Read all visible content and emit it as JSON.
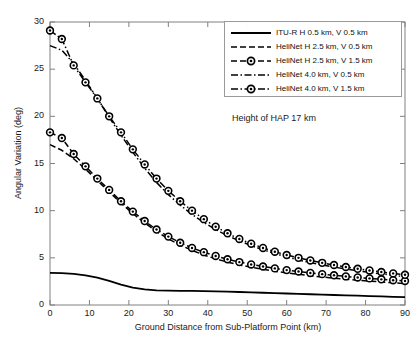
{
  "chart_data": {
    "type": "line",
    "title": "",
    "xlabel": "Ground Distance from Sub-Platform Point (km)",
    "ylabel": "Angular Variation (deg)",
    "xlim": [
      0,
      90
    ],
    "ylim": [
      0,
      30
    ],
    "xticks": [
      0,
      10,
      20,
      30,
      40,
      50,
      60,
      70,
      80,
      90
    ],
    "yticks": [
      0,
      5,
      10,
      15,
      20,
      25,
      30
    ],
    "grid": false,
    "legend_position": "top-right",
    "annotation": "Height of HAP 17 km",
    "x": [
      0,
      3,
      6,
      9,
      12,
      15,
      18,
      21,
      24,
      27,
      30,
      33,
      36,
      39,
      42,
      45,
      48,
      51,
      54,
      57,
      60,
      63,
      66,
      69,
      72,
      75,
      78,
      81,
      84,
      87,
      90
    ],
    "series": [
      {
        "name": "ITU-R H 0.5 km, V 0.5 km",
        "style": "solid",
        "marker": "none",
        "values": [
          3.4,
          3.38,
          3.3,
          3.15,
          2.9,
          2.55,
          2.15,
          1.85,
          1.65,
          1.56,
          1.52,
          1.5,
          1.49,
          1.47,
          1.45,
          1.42,
          1.38,
          1.34,
          1.3,
          1.26,
          1.22,
          1.18,
          1.14,
          1.1,
          1.06,
          1.02,
          0.99,
          0.95,
          0.91,
          0.87,
          0.83
        ]
      },
      {
        "name": "HeliNet H 2.5 km, V 0.5 km",
        "style": "dashed",
        "marker": "none",
        "values": [
          17.0,
          16.4,
          15.5,
          14.4,
          13.2,
          12.0,
          10.8,
          9.7,
          8.7,
          7.8,
          7.0,
          6.35,
          5.8,
          5.3,
          4.9,
          4.55,
          4.25,
          4.0,
          3.78,
          3.58,
          3.4,
          3.25,
          3.1,
          2.97,
          2.85,
          2.74,
          2.63,
          2.53,
          2.44,
          2.35,
          2.27
        ]
      },
      {
        "name": "HeliNet H 2.5 km, V 1.5 km",
        "style": "dashed",
        "marker": "circle",
        "values": [
          18.3,
          17.7,
          16.0,
          14.7,
          13.4,
          12.2,
          11.0,
          9.9,
          8.9,
          8.0,
          7.25,
          6.6,
          6.05,
          5.6,
          5.2,
          4.85,
          4.55,
          4.3,
          4.08,
          3.88,
          3.7,
          3.55,
          3.4,
          3.27,
          3.15,
          3.03,
          2.92,
          2.82,
          2.72,
          2.63,
          2.55
        ]
      },
      {
        "name": "HeliNet 4.0 km, V 0.5 km",
        "style": "dashdot",
        "marker": "none",
        "values": [
          27.5,
          27.0,
          25.6,
          23.8,
          21.9,
          19.9,
          18.0,
          16.2,
          14.5,
          13.0,
          11.7,
          10.6,
          9.6,
          8.75,
          8.0,
          7.35,
          6.8,
          6.3,
          5.85,
          5.45,
          5.1,
          4.78,
          4.5,
          4.25,
          4.02,
          3.82,
          3.63,
          3.46,
          3.3,
          3.15,
          3.0
        ]
      },
      {
        "name": "HeliNet 4.0 km, V 1.5 km",
        "style": "dashdot",
        "marker": "circle",
        "values": [
          29.1,
          28.2,
          25.4,
          23.6,
          21.9,
          20.0,
          18.3,
          16.5,
          14.9,
          13.4,
          12.1,
          11.0,
          10.0,
          9.1,
          8.3,
          7.6,
          7.0,
          6.5,
          6.05,
          5.65,
          5.3,
          5.0,
          4.72,
          4.47,
          4.24,
          4.03,
          3.84,
          3.66,
          3.5,
          3.35,
          3.2
        ]
      }
    ]
  },
  "colors": {
    "line": "#000000",
    "axis": "#808080",
    "text": "#1a1a1a",
    "background": "#ffffff"
  }
}
